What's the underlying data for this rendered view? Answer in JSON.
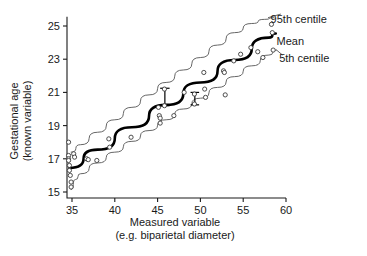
{
  "chart_data": {
    "type": "scatter",
    "title": "",
    "xlabel": "Measured variable (e.g. biparietal diameter)",
    "xlabel_line1": "Measured variable",
    "xlabel_line2": "(e.g. biparietal diameter)",
    "ylabel": "Gestational age (known variable)",
    "ylabel_line1": "Gestational age",
    "ylabel_line2": "(known variable)",
    "xlim": [
      34,
      60
    ],
    "ylim": [
      14.7,
      25.6
    ],
    "xticks": [
      35,
      40,
      45,
      50,
      55,
      60
    ],
    "yticks": [
      15,
      17,
      19,
      21,
      23,
      25
    ],
    "grid": false,
    "legend_position": "right-inline-annotations",
    "annotations": [
      {
        "name": "upper-centile",
        "text": "95th centile",
        "x": 57.5,
        "y": 25.45
      },
      {
        "name": "mean-line",
        "text": "Mean",
        "x": 58.2,
        "y": 24.1
      },
      {
        "name": "lower-centile",
        "text": "5th centile",
        "x": 58.5,
        "y": 23.1
      }
    ],
    "series": [
      {
        "name": "Observations",
        "marker": "open-circle",
        "points": [
          [
            34.6,
            18.0
          ],
          [
            34.6,
            17.2
          ],
          [
            34.6,
            17.0
          ],
          [
            34.6,
            16.9
          ],
          [
            34.7,
            16.6
          ],
          [
            34.7,
            16.3
          ],
          [
            34.8,
            16.0
          ],
          [
            34.9,
            15.6
          ],
          [
            34.9,
            15.3
          ],
          [
            35.2,
            17.3
          ],
          [
            35.3,
            17.1
          ],
          [
            36.7,
            17.0
          ],
          [
            36.9,
            16.95
          ],
          [
            37.9,
            16.9
          ],
          [
            39.3,
            18.2
          ],
          [
            39.4,
            17.7
          ],
          [
            41.9,
            18.3
          ],
          [
            45.1,
            20.1
          ],
          [
            45.2,
            19.6
          ],
          [
            45.3,
            19.45
          ],
          [
            45.3,
            19.15
          ],
          [
            45.8,
            21.2
          ],
          [
            45.8,
            20.2
          ],
          [
            46.9,
            19.6
          ],
          [
            48.1,
            21.0
          ],
          [
            49.3,
            20.9
          ],
          [
            49.3,
            20.3
          ],
          [
            50.4,
            22.2
          ],
          [
            50.5,
            21.2
          ],
          [
            50.6,
            20.7
          ],
          [
            52.7,
            22.3
          ],
          [
            52.8,
            22.2
          ],
          [
            52.9,
            20.85
          ],
          [
            53.9,
            22.9
          ],
          [
            54.7,
            23.3
          ],
          [
            55.9,
            23.7
          ],
          [
            56.7,
            23.45
          ],
          [
            57.3,
            23.1
          ],
          [
            58.3,
            25.1
          ],
          [
            58.4,
            24.6
          ],
          [
            58.5,
            23.55
          ]
        ]
      }
    ],
    "curves": [
      {
        "name": "95th centile",
        "style": "thin",
        "points": [
          [
            34.9,
            17.4
          ],
          [
            36.0,
            17.85
          ],
          [
            38.0,
            18.6
          ],
          [
            40.0,
            19.35
          ],
          [
            42.0,
            20.1
          ],
          [
            44.0,
            20.85
          ],
          [
            46.0,
            21.6
          ],
          [
            48.0,
            22.35
          ],
          [
            50.0,
            23.1
          ],
          [
            52.0,
            23.85
          ],
          [
            54.0,
            24.6
          ],
          [
            56.0,
            25.15
          ],
          [
            57.5,
            25.4
          ],
          [
            58.6,
            25.5
          ]
        ]
      },
      {
        "name": "Mean",
        "style": "thick",
        "points": [
          [
            34.7,
            16.45
          ],
          [
            38.0,
            17.55
          ],
          [
            42.0,
            18.9
          ],
          [
            46.0,
            20.25
          ],
          [
            50.0,
            21.6
          ],
          [
            54.0,
            22.95
          ],
          [
            58.0,
            24.3
          ],
          [
            58.8,
            24.55
          ]
        ]
      },
      {
        "name": "5th centile",
        "style": "thin",
        "points": [
          [
            34.9,
            15.15
          ],
          [
            35.4,
            15.75
          ],
          [
            36.0,
            16.1
          ],
          [
            38.0,
            16.75
          ],
          [
            40.0,
            17.4
          ],
          [
            42.0,
            18.05
          ],
          [
            44.0,
            18.7
          ],
          [
            46.0,
            19.35
          ],
          [
            48.0,
            20.0
          ],
          [
            50.0,
            20.65
          ],
          [
            52.0,
            21.3
          ],
          [
            54.0,
            21.95
          ],
          [
            56.0,
            22.6
          ],
          [
            58.0,
            23.25
          ],
          [
            58.9,
            23.55
          ]
        ]
      }
    ],
    "error_bars": [
      {
        "name": "error-bar-left",
        "x": 45.85,
        "ymin": 20.2,
        "ymax": 21.25,
        "cap_width": 0.55
      },
      {
        "name": "error-bar-right",
        "x": 49.35,
        "ymin": 20.25,
        "ymax": 21.0,
        "cap_width": 0.5
      }
    ],
    "leader_lines": [
      {
        "name": "leader-95th",
        "from": [
          57.9,
          25.5
        ],
        "to": [
          59.4,
          25.72
        ]
      },
      {
        "name": "leader-5th",
        "from": [
          58.9,
          23.55
        ],
        "to": [
          59.6,
          23.25
        ]
      }
    ],
    "colors": {
      "axis": "#1a1a1a",
      "marker_stroke": "#3a3a3a",
      "curve_thin": "#555555",
      "curve_thick": "#000000",
      "text": "#1a1a1a",
      "background": "#ffffff"
    }
  }
}
